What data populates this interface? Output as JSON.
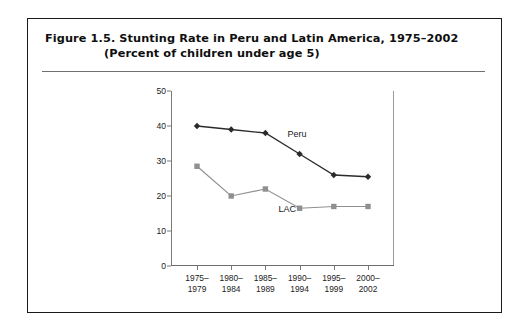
{
  "figure": {
    "title_line1": "Figure 1.5.  Stunting Rate in Peru and Latin America, 1975–2002",
    "title_line2": "(Percent of children under age 5)"
  },
  "chart_data": {
    "type": "line",
    "title": "Stunting Rate in Peru and Latin America, 1975–2002",
    "subtitle": "(Percent of children under age 5)",
    "xlabel": "",
    "ylabel": "",
    "ylim": [
      0,
      50
    ],
    "yticks": [
      0,
      10,
      20,
      30,
      40,
      50
    ],
    "grid": false,
    "legend_position": "inline-labels",
    "categories": [
      "1975–\n1979",
      "1980–\n1984",
      "1985–\n1989",
      "1990–\n1994",
      "1995–\n1999",
      "2000–\n2002"
    ],
    "categories_line1": [
      "1975–",
      "1980–",
      "1985–",
      "1990–",
      "1995–",
      "2000–"
    ],
    "categories_line2": [
      "1979",
      "1984",
      "1989",
      "1994",
      "1999",
      "2002"
    ],
    "series": [
      {
        "name": "Peru",
        "values": [
          40,
          39,
          38,
          32,
          26,
          25.5
        ],
        "color": "#2b2b2b",
        "marker": "diamond"
      },
      {
        "name": "LAC",
        "values": [
          28.5,
          20,
          22,
          16.5,
          17,
          17
        ],
        "color": "#8f8f8f",
        "marker": "square"
      }
    ],
    "annotations": [
      {
        "text": "Peru",
        "series": "Peru"
      },
      {
        "text": "LAC",
        "series": "LAC"
      }
    ]
  },
  "colors": {
    "peru_line": "#2b2b2b",
    "lac_line": "#8f8f8f",
    "axis": "#7a7a7a",
    "border": "#1a1a1a",
    "text": "#0f0f0f"
  }
}
